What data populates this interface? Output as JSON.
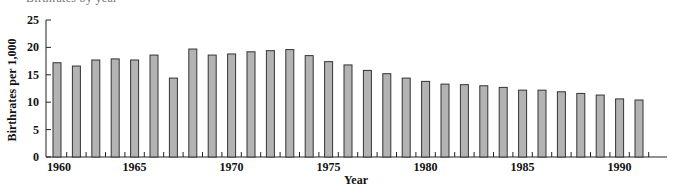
{
  "chart_data": {
    "type": "bar",
    "title": "",
    "xlabel": "Year",
    "ylabel": "Birthrates per 1,000",
    "ylim": [
      0,
      25
    ],
    "yticks": [
      0,
      5,
      10,
      15,
      20,
      25
    ],
    "xtick_labels": [
      "1960",
      "1965",
      "1970",
      "1975",
      "1980",
      "1985",
      "1990"
    ],
    "grid": false,
    "legend": null,
    "bar_color": "#b3b3b3",
    "bar_edge_color": "#333333",
    "categories": [
      "1961",
      "1962",
      "1963",
      "1964",
      "1965",
      "1966",
      "1967",
      "1968",
      "1969",
      "1970",
      "1971",
      "1972",
      "1973",
      "1974",
      "1975",
      "1976",
      "1977",
      "1978",
      "1979",
      "1980",
      "1981",
      "1982",
      "1983",
      "1984",
      "1985",
      "1986",
      "1987",
      "1988",
      "1989",
      "1990",
      "1991"
    ],
    "values": [
      17.2,
      16.6,
      17.7,
      17.9,
      17.7,
      18.6,
      14.4,
      19.7,
      18.6,
      18.8,
      19.2,
      19.4,
      19.6,
      18.5,
      17.4,
      16.8,
      15.8,
      15.2,
      14.4,
      13.8,
      13.3,
      13.2,
      13.0,
      12.7,
      12.2,
      12.2,
      11.9,
      11.6,
      11.3,
      10.6,
      10.4
    ]
  },
  "header": {
    "cut_off_caption": "Birthrates by year"
  }
}
